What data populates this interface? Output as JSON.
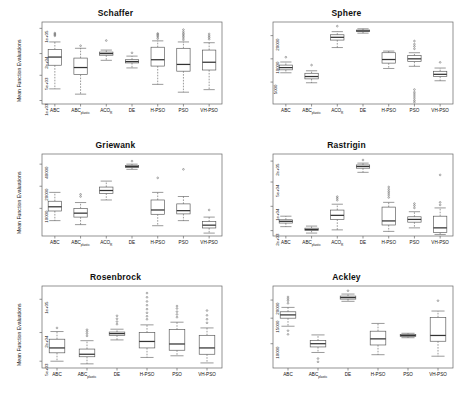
{
  "figure": {
    "ylabel": "Mean Function Evaluations",
    "panel_count": 6,
    "box_color": "#555555",
    "median_color": "#333333",
    "outlier_color": "#666666",
    "frame_color": "#666666"
  },
  "chart_data": [
    {
      "type": "box",
      "title": "Schaffer",
      "xlabel": "",
      "ylabel": "Mean Function Evaluations",
      "yscale": "log",
      "yticks": [
        "1e+03",
        "5e+03",
        "2e+04",
        "1e+05"
      ],
      "ytickvals": [
        1000,
        5000,
        20000,
        100000
      ],
      "ylim": [
        800,
        150000
      ],
      "categories": [
        "ABC",
        "ABCplastic",
        "ACOR",
        "DE",
        "H-PSO",
        "PSO",
        "VH-PSO"
      ],
      "boxes": [
        {
          "name": "ABC",
          "low": 2100,
          "q1": 9500,
          "median": 16000,
          "q3": 26000,
          "high": 42000,
          "outliers": [
            62000,
            66000,
            70000,
            74000
          ]
        },
        {
          "name": "ABCplastic",
          "low": 1500,
          "q1": 5200,
          "median": 8200,
          "q3": 15000,
          "high": 28000,
          "outliers": [
            33000
          ]
        },
        {
          "name": "ACOR",
          "low": 13000,
          "q1": 18000,
          "median": 20000,
          "q3": 22000,
          "high": 25000,
          "outliers": [
            46000
          ]
        },
        {
          "name": "DE",
          "low": 8000,
          "q1": 11000,
          "median": 12000,
          "q3": 13500,
          "high": 17000,
          "outliers": [
            21000
          ]
        },
        {
          "name": "H-PSO",
          "low": 2800,
          "q1": 9000,
          "median": 13500,
          "q3": 30000,
          "high": 45000,
          "outliers": [
            52000,
            58000,
            63000,
            68000,
            72000
          ]
        },
        {
          "name": "PSO",
          "low": 1700,
          "q1": 6500,
          "median": 10000,
          "q3": 28000,
          "high": 42000,
          "outliers": [
            48000,
            54000,
            60000,
            66000,
            72000,
            80000,
            92000
          ]
        },
        {
          "name": "VH-PSO",
          "low": 2000,
          "q1": 7000,
          "median": 11500,
          "q3": 25000,
          "high": 40000,
          "outliers": [
            50000,
            56000,
            62000,
            70000
          ]
        }
      ]
    },
    {
      "type": "box",
      "title": "Sphere",
      "xlabel": "",
      "ylabel": "",
      "yscale": "log",
      "yticks": [
        "5000",
        "10000",
        "20000"
      ],
      "ytickvals": [
        5000,
        10000,
        20000
      ],
      "ylim": [
        2600,
        30000
      ],
      "categories": [
        "ABC",
        "ABCplastic",
        "ACOR",
        "DE",
        "H-PSO",
        "PSO",
        "VH-PSO"
      ],
      "boxes": [
        {
          "name": "ABC",
          "low": 6600,
          "q1": 7200,
          "median": 7700,
          "q3": 8300,
          "high": 9100,
          "outliers": [
            10500
          ]
        },
        {
          "name": "ABCplastic",
          "low": 4900,
          "q1": 5500,
          "median": 5900,
          "q3": 6500,
          "high": 7000,
          "outliers": [
            8300
          ]
        },
        {
          "name": "ACOR",
          "low": 14000,
          "q1": 17500,
          "median": 19000,
          "q3": 20500,
          "high": 22500,
          "outliers": [
            26500
          ]
        },
        {
          "name": "DE",
          "low": 21500,
          "q1": 22500,
          "median": 23000,
          "q3": 23600,
          "high": 24500,
          "outliers": []
        },
        {
          "name": "H-PSO",
          "low": 7500,
          "q1": 8800,
          "median": 9800,
          "q3": 12000,
          "high": 12600,
          "outliers": []
        },
        {
          "name": "PSO",
          "low": 8000,
          "q1": 9200,
          "median": 10000,
          "q3": 11000,
          "high": 12000,
          "outliers": [
            13500,
            14500,
            15500,
            17000,
            4000,
            3700,
            3500,
            3300,
            3100,
            2900,
            2750
          ]
        },
        {
          "name": "VH-PSO",
          "low": 5200,
          "q1": 5900,
          "median": 6300,
          "q3": 6900,
          "high": 7600,
          "outliers": [
            9000
          ]
        }
      ]
    },
    {
      "type": "box",
      "title": "Griewank",
      "xlabel": "",
      "ylabel": "Mean Function Evaluations",
      "yscale": "log",
      "yticks": [
        "10000",
        "20000",
        "40000"
      ],
      "ytickvals": [
        10000,
        20000,
        40000
      ],
      "ylim": [
        4200,
        55000
      ],
      "categories": [
        "ABC",
        "ABCplastic",
        "ACOR",
        "DE",
        "H-PSO",
        "PSO",
        "VH-PSO"
      ],
      "boxes": [
        {
          "name": "ABC",
          "low": 6800,
          "q1": 9200,
          "median": 10500,
          "q3": 12500,
          "high": 16500,
          "outliers": []
        },
        {
          "name": "ABCplastic",
          "low": 6000,
          "q1": 7600,
          "median": 8600,
          "q3": 10000,
          "high": 12000,
          "outliers": [
            14500,
            15500
          ]
        },
        {
          "name": "ACOR",
          "low": 13000,
          "q1": 16000,
          "median": 17500,
          "q3": 19500,
          "high": 23500,
          "outliers": []
        },
        {
          "name": "DE",
          "low": 34000,
          "q1": 36000,
          "median": 37000,
          "q3": 38500,
          "high": 40000,
          "outliers": [
            44000
          ]
        },
        {
          "name": "H-PSO",
          "low": 5800,
          "q1": 8300,
          "median": 9500,
          "q3": 13000,
          "high": 16500,
          "outliers": [
            26000
          ]
        },
        {
          "name": "PSO",
          "low": 6800,
          "q1": 8400,
          "median": 9300,
          "q3": 11500,
          "high": 14500,
          "outliers": [
            34000
          ]
        },
        {
          "name": "VH-PSO",
          "low": 4600,
          "q1": 5400,
          "median": 5900,
          "q3": 6600,
          "high": 7600,
          "outliers": [
            9500
          ]
        }
      ]
    },
    {
      "type": "box",
      "title": "Rastrigin",
      "xlabel": "",
      "ylabel": "",
      "yscale": "log",
      "yticks": [
        "2e+03",
        "1e+04",
        "5e+04",
        "2e+05"
      ],
      "ytickvals": [
        2000,
        10000,
        50000,
        200000
      ],
      "ylim": [
        1400,
        320000
      ],
      "categories": [
        "ABC",
        "ABCplastic",
        "ACOR",
        "DE",
        "H-PSO",
        "PSO",
        "VH-PSO"
      ],
      "boxes": [
        {
          "name": "ABC",
          "low": 2600,
          "q1": 3300,
          "median": 3700,
          "q3": 4100,
          "high": 5200,
          "outliers": []
        },
        {
          "name": "ABCplastic",
          "low": 1700,
          "q1": 2000,
          "median": 2150,
          "q3": 2350,
          "high": 2700,
          "outliers": []
        },
        {
          "name": "ACOR",
          "low": 2100,
          "q1": 4200,
          "median": 5500,
          "q3": 7800,
          "high": 11500,
          "outliers": [
            15000,
            17000,
            19000
          ]
        },
        {
          "name": "DE",
          "low": 95000,
          "q1": 125000,
          "median": 140000,
          "q3": 155000,
          "high": 175000,
          "outliers": [
            215000
          ]
        },
        {
          "name": "H-PSO",
          "low": 1900,
          "q1": 2900,
          "median": 3800,
          "q3": 9500,
          "high": 13000,
          "outliers": [
            18000,
            21000,
            24000,
            27000,
            31000,
            36000
          ]
        },
        {
          "name": "PSO",
          "low": 2400,
          "q1": 3500,
          "median": 4200,
          "q3": 5000,
          "high": 7000,
          "outliers": [
            9000,
            10500,
            12000
          ]
        },
        {
          "name": "VH-PSO",
          "low": 1550,
          "q1": 1750,
          "median": 2400,
          "q3": 5200,
          "high": 9000,
          "outliers": [
            11000,
            13000,
            80000
          ]
        }
      ]
    },
    {
      "type": "box",
      "title": "Rosenbrock",
      "xlabel": "",
      "ylabel": "Mean Function Evaluations",
      "yscale": "log",
      "yticks": [
        "5e+03",
        "2e+04",
        "1e+05"
      ],
      "ytickvals": [
        5000,
        20000,
        100000
      ],
      "ylim": [
        3600,
        190000
      ],
      "categories": [
        "ABC",
        "ABCplastic",
        "DE",
        "H-PSO",
        "PSO",
        "VH-PSO"
      ],
      "boxes": [
        {
          "name": "ABC",
          "low": 5000,
          "q1": 7500,
          "median": 9500,
          "q3": 14500,
          "high": 21000,
          "outliers": [
            25000
          ]
        },
        {
          "name": "ABCplastic",
          "low": 4400,
          "q1": 6200,
          "median": 7000,
          "q3": 9000,
          "high": 13500,
          "outliers": [
            17000,
            19000,
            21000,
            23000
          ]
        },
        {
          "name": "DE",
          "low": 14000,
          "q1": 17500,
          "median": 19000,
          "q3": 20500,
          "high": 23500,
          "outliers": [
            30000,
            34000,
            39000,
            45000
          ]
        },
        {
          "name": "H-PSO",
          "low": 6000,
          "q1": 9500,
          "median": 13000,
          "q3": 20000,
          "high": 29000,
          "outliers": [
            38000,
            44000,
            52000,
            62000,
            75000,
            90000,
            110000,
            135000
          ]
        },
        {
          "name": "PSO",
          "low": 6500,
          "q1": 8500,
          "median": 11500,
          "q3": 23000,
          "high": 33000,
          "outliers": [
            42000,
            48000,
            55000,
            64000,
            72000
          ]
        },
        {
          "name": "VH-PSO",
          "low": 4600,
          "q1": 7000,
          "median": 9500,
          "q3": 17500,
          "high": 25000,
          "outliers": [
            32000,
            38000,
            46000,
            58000
          ]
        }
      ]
    },
    {
      "type": "box",
      "title": "Ackley",
      "xlabel": "",
      "ylabel": "",
      "yscale": "log",
      "yticks": [
        "10000",
        "15000",
        "20000"
      ],
      "ytickvals": [
        10000,
        15000,
        20000
      ],
      "ylim": [
        6800,
        25000
      ],
      "categories": [
        "ABC",
        "ABCplastic",
        "DE",
        "H-PSO",
        "PSO",
        "VH-PSO"
      ],
      "boxes": [
        {
          "name": "ABC",
          "low": 13200,
          "q1": 15000,
          "median": 15800,
          "q3": 16600,
          "high": 17800,
          "outliers": [
            19000,
            19800,
            20400,
            21000,
            12300,
            11600
          ]
        },
        {
          "name": "ABCplastic",
          "low": 8700,
          "q1": 9500,
          "median": 10000,
          "q3": 10500,
          "high": 11500,
          "outliers": [
            7900,
            7500
          ]
        },
        {
          "name": "DE",
          "low": 19600,
          "q1": 20300,
          "median": 20800,
          "q3": 21300,
          "high": 22000,
          "outliers": [
            23200
          ]
        },
        {
          "name": "H-PSO",
          "low": 8400,
          "q1": 9800,
          "median": 10800,
          "q3": 12200,
          "high": 13800,
          "outliers": []
        },
        {
          "name": "PSO",
          "low": 11000,
          "q1": 11200,
          "median": 11400,
          "q3": 11600,
          "high": 11800,
          "outliers": []
        },
        {
          "name": "VH-PSO",
          "low": 8200,
          "q1": 10400,
          "median": 11400,
          "q3": 15200,
          "high": 16800,
          "outliers": [
            19800
          ]
        }
      ]
    }
  ]
}
